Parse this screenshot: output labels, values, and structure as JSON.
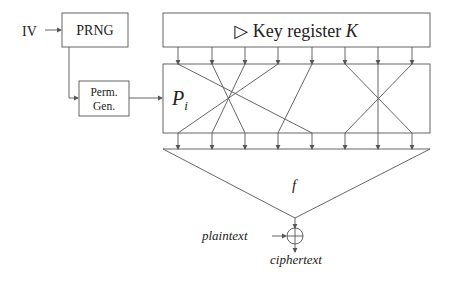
{
  "labels": {
    "iv": "IV",
    "prng": "PRNG",
    "perm_gen_line1": "Perm.",
    "perm_gen_line2": "Gen.",
    "key_register_prefix": "▷ Key register ",
    "key_register_var": "K",
    "perm_var": "P",
    "perm_sub": "i",
    "function": "f",
    "plaintext": "plaintext",
    "ciphertext": "ciphertext"
  },
  "wires": {
    "x": [
      178,
      212,
      245,
      278,
      312,
      345,
      378,
      412
    ],
    "permutation_top_to_bottom": [
      [
        178,
        312
      ],
      [
        212,
        245
      ],
      [
        245,
        212
      ],
      [
        278,
        178
      ],
      [
        312,
        278
      ],
      [
        345,
        412
      ],
      [
        378,
        378
      ],
      [
        412,
        345
      ]
    ]
  },
  "colors": {
    "stroke": "#555555",
    "text": "#222222"
  }
}
